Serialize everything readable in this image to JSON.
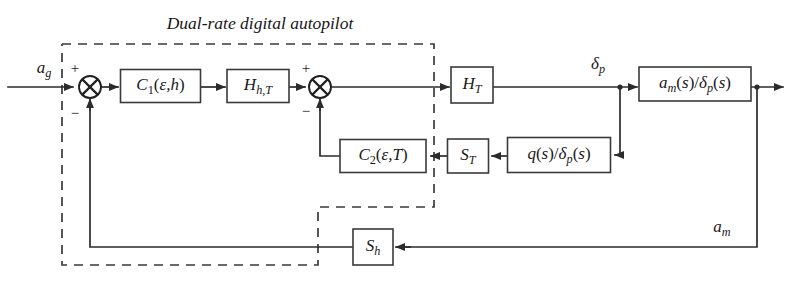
{
  "diagram": {
    "title": "Dual-rate digital autopilot",
    "type": "control-system-block-diagram",
    "canvas": {
      "width": 793,
      "height": 296
    },
    "colors": {
      "background": "#ffffff",
      "line": "#2b2b2b",
      "block_stroke": "#3a3a3a",
      "text": "#1a1a1a",
      "dashed_boundary": "#3a3a3a"
    },
    "boundary": {
      "name": "dual-rate-digital-autopilot-boundary",
      "style": "dashed",
      "label": "Dual-rate digital autopilot"
    },
    "blocks": [
      {
        "id": "c1",
        "name": "controller-c1-block",
        "label": "C1(ε,h)",
        "base": "C",
        "sub": "1",
        "args": "(ε,h)",
        "x": 160.5,
        "y": 86,
        "w": 80,
        "h": 33
      },
      {
        "id": "hht",
        "name": "hold-h-hT-block",
        "label": "Hh,T",
        "base": "H",
        "sub": "h,T",
        "args": "",
        "x": 258,
        "y": 86,
        "w": 62,
        "h": 33
      },
      {
        "id": "ht",
        "name": "hold-hT-block",
        "label": "HT",
        "base": "H",
        "sub": "T",
        "args": "",
        "x": 472,
        "y": 85,
        "w": 42,
        "h": 36
      },
      {
        "id": "am",
        "name": "plant-am-over-deltap-block",
        "label": "am(s)/δp(s)",
        "base": "",
        "sub": "",
        "args": "",
        "x": 695,
        "y": 84,
        "w": 112,
        "h": 34
      },
      {
        "id": "c2",
        "name": "controller-c2-block",
        "label": "C2(ε,T)",
        "base": "C",
        "sub": "2",
        "args": "(ε,T)",
        "x": 383,
        "y": 156,
        "w": 86,
        "h": 33
      },
      {
        "id": "st",
        "name": "sampler-sT-block",
        "label": "ST",
        "base": "S",
        "sub": "T",
        "args": "",
        "x": 468,
        "y": 156,
        "w": 41,
        "h": 34
      },
      {
        "id": "qdp",
        "name": "plant-q-over-deltap-block",
        "label": "q(s)/δp(s)",
        "base": "",
        "sub": "",
        "args": "",
        "x": 559,
        "y": 155,
        "w": 103,
        "h": 35
      },
      {
        "id": "sh",
        "name": "sampler-sh-block",
        "label": "Sh",
        "base": "S",
        "sub": "h",
        "args": "",
        "x": 373,
        "y": 247,
        "w": 40,
        "h": 36
      }
    ],
    "summing_junctions": [
      {
        "id": "sum1",
        "name": "summing-junction-outer",
        "x": 90,
        "y": 87,
        "r": 11,
        "signs": [
          {
            "text": "+",
            "x": 75,
            "y": 68
          },
          {
            "text": "−",
            "x": 75,
            "y": 113
          }
        ]
      },
      {
        "id": "sum2",
        "name": "summing-junction-inner",
        "x": 320,
        "y": 87,
        "r": 11,
        "signs": [
          {
            "text": "+",
            "x": 306,
            "y": 68
          },
          {
            "text": "−",
            "x": 306,
            "y": 111
          }
        ]
      }
    ],
    "signals": [
      {
        "id": "ag",
        "name": "input-signal-ag-label",
        "label": "ag",
        "base": "a",
        "sub": "g",
        "x": 44,
        "y": 69
      },
      {
        "id": "dp",
        "name": "signal-delta-p-label",
        "label": "δp",
        "base": "δ",
        "sub": "p",
        "x": 598,
        "y": 65
      },
      {
        "id": "amo",
        "name": "output-signal-am-label",
        "label": "am",
        "base": "a",
        "sub": "m",
        "x": 722,
        "y": 228
      }
    ],
    "connections": [
      {
        "from": "input-ag",
        "to": "summing-junction-outer"
      },
      {
        "from": "summing-junction-outer",
        "to": "controller-c1-block"
      },
      {
        "from": "controller-c1-block",
        "to": "hold-h-hT-block"
      },
      {
        "from": "hold-h-hT-block",
        "to": "summing-junction-inner"
      },
      {
        "from": "summing-junction-inner",
        "to": "hold-hT-block"
      },
      {
        "from": "hold-hT-block",
        "to": "plant-am-over-deltap-block"
      },
      {
        "from": "plant-am-over-deltap-block",
        "to": "output-am"
      },
      {
        "from": "signal-delta-p-branch",
        "to": "plant-q-over-deltap-block"
      },
      {
        "from": "plant-q-over-deltap-block",
        "to": "sampler-sT-block"
      },
      {
        "from": "sampler-sT-block",
        "to": "controller-c2-block"
      },
      {
        "from": "controller-c2-block",
        "to": "summing-junction-inner"
      },
      {
        "from": "output-am",
        "to": "sampler-sh-block"
      },
      {
        "from": "sampler-sh-block",
        "to": "summing-junction-outer"
      }
    ]
  }
}
